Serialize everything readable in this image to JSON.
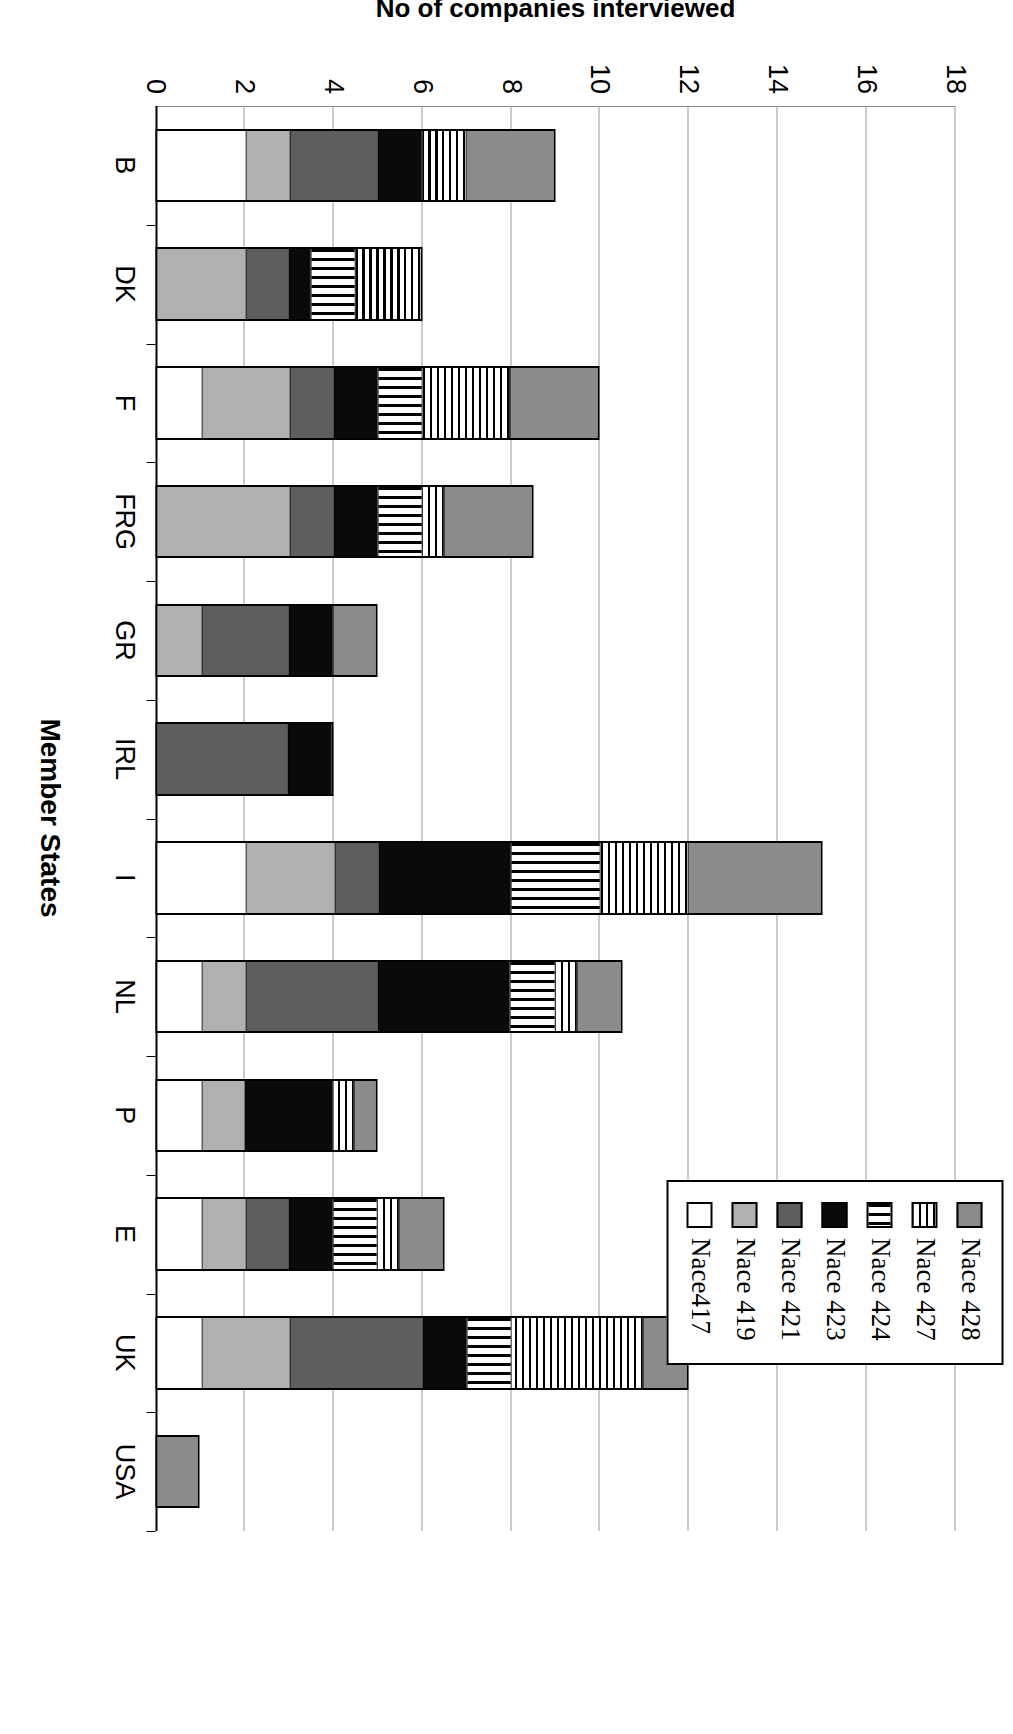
{
  "chart_data": {
    "type": "bar",
    "orientation": "horizontal-rotated",
    "title": "",
    "xlabel": "Member States",
    "ylabel": "No of companies interviewed",
    "ylim": [
      0,
      18
    ],
    "ytick_labels": [
      "0",
      "2",
      "4",
      "6",
      "8",
      "10",
      "12",
      "14",
      "16",
      "18"
    ],
    "ytick_values": [
      0,
      2,
      4,
      6,
      8,
      10,
      12,
      14,
      16,
      18
    ],
    "grid": true,
    "legend_position": "top-right",
    "categories": [
      "B",
      "DK",
      "F",
      "FRG",
      "GR",
      "IRL",
      "I",
      "NL",
      "P",
      "E",
      "UK",
      "USA"
    ],
    "series": [
      {
        "name": "Nace417",
        "color": "#ffffff",
        "pattern": "solid-white",
        "values": [
          2,
          0,
          1,
          0,
          0,
          0,
          2,
          1,
          1,
          1,
          1,
          0
        ]
      },
      {
        "name": "Nace 419",
        "color": "#b0b0b0",
        "pattern": "light-gray",
        "values": [
          1,
          2,
          2,
          3,
          1,
          0,
          2,
          1,
          1,
          1,
          2,
          0
        ]
      },
      {
        "name": "Nace 421",
        "color": "#5e5e5e",
        "pattern": "mid-gray",
        "values": [
          2,
          1,
          1,
          1,
          2,
          3,
          1,
          3,
          0,
          1,
          3,
          0
        ]
      },
      {
        "name": "Nace 423",
        "color": "#0a0a0a",
        "pattern": "black",
        "values": [
          1,
          0.5,
          1,
          1,
          1,
          1,
          3,
          3,
          2,
          1,
          1,
          0
        ]
      },
      {
        "name": "Nace 424",
        "color": "#ffffff",
        "pattern": "vertical-stripes",
        "values": [
          0,
          1,
          1,
          1,
          0,
          0,
          2,
          1,
          0,
          1,
          1,
          0
        ]
      },
      {
        "name": "Nace 427",
        "color": "#ffffff",
        "pattern": "horizontal-stripes",
        "values": [
          1,
          1.5,
          2,
          0.5,
          0,
          0,
          2,
          0.5,
          0.5,
          0.5,
          3,
          0
        ]
      },
      {
        "name": "Nace 428",
        "color": "#8b8b8b",
        "pattern": "dark-gray",
        "values": [
          2,
          0,
          2,
          2,
          1,
          0,
          3,
          1,
          0.5,
          1,
          1,
          1
        ]
      }
    ],
    "totals": [
      9,
      6,
      10,
      8.5,
      5,
      4,
      15,
      10.5,
      5,
      6.5,
      12,
      1
    ]
  },
  "legend": {
    "items": [
      {
        "label": "Nace 428",
        "pattern": "dark-gray"
      },
      {
        "label": "Nace 427",
        "pattern": "horizontal-stripes"
      },
      {
        "label": "Nace 424",
        "pattern": "vertical-stripes"
      },
      {
        "label": "Nace 423",
        "pattern": "black"
      },
      {
        "label": "Nace 421",
        "pattern": "mid-gray"
      },
      {
        "label": "Nace 419",
        "pattern": "light-gray"
      },
      {
        "label": "Nace417",
        "pattern": "solid-white"
      }
    ]
  },
  "axes": {
    "value_axis_title": "No of companies interviewed",
    "category_axis_title": "Member States"
  }
}
